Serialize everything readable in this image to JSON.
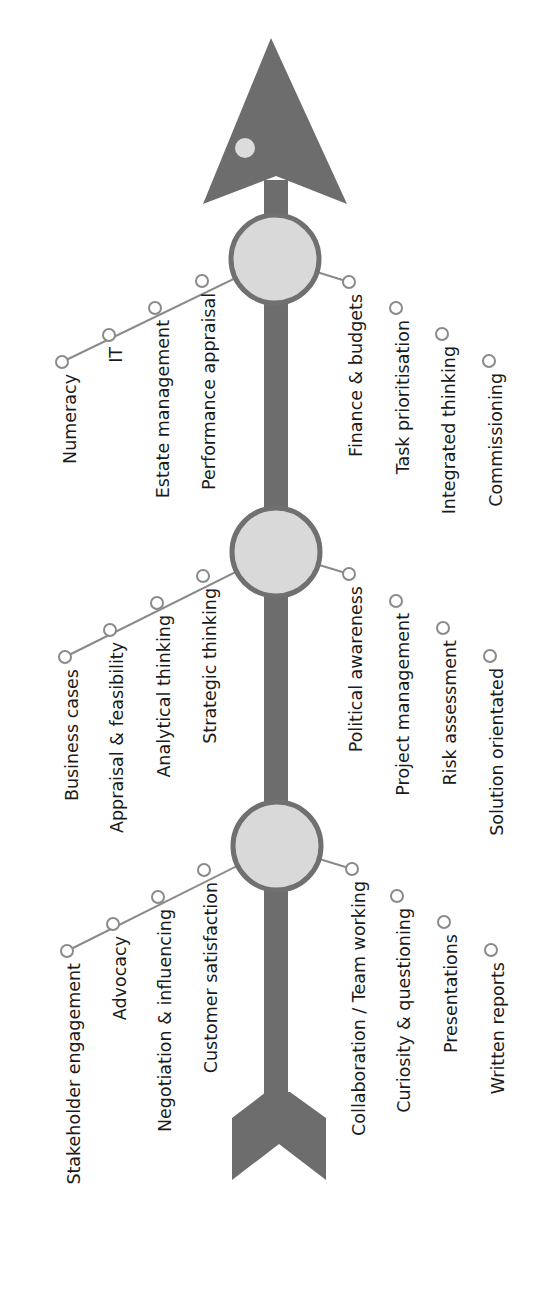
{
  "colors": {
    "arrow": "#6d6d6d",
    "hub_fill": "#d9d9d9",
    "hub_stroke": "#707070",
    "connector": "#8a8a8a",
    "node_fill": "#ffffff",
    "node_stroke": "#8a8a8a",
    "text": "#1a1a1a",
    "dot": "#dcdcdc"
  },
  "hubs": [
    {
      "name": "top",
      "left": [
        "Numeracy",
        "IT",
        "Estate management",
        "Performance appraisal"
      ],
      "right": [
        "Finance & budgets",
        "Task prioritisation",
        "Integrated thinking",
        "Commissioning"
      ]
    },
    {
      "name": "middle",
      "left": [
        "Business cases",
        "Appraisal & feasibility",
        "Analytical thinking",
        "Strategic thinking"
      ],
      "right": [
        "Political awareness",
        "Project management",
        "Risk assessment",
        "Solution orientated"
      ]
    },
    {
      "name": "bottom",
      "left": [
        "Stakeholder engagement",
        "Advocacy",
        "Negotiation & influencing",
        "Customer satisfaction"
      ],
      "right": [
        "Collaboration / Team working",
        "Curiosity & questioning",
        "Presentations",
        "Written reports"
      ]
    }
  ]
}
